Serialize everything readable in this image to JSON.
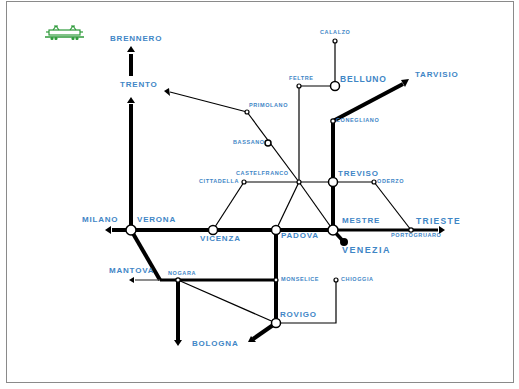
{
  "map": {
    "title_icon": "electric-locomotive-icon",
    "colors": {
      "line": "#000000",
      "label": "#3f86c6",
      "icon": "#2e9a3a",
      "frame": "#8a8a8a"
    },
    "stations": {
      "brennero": "BRENNERO",
      "trento": "TRENTO",
      "calalzo": "CALALZO",
      "feltre": "FELTRE",
      "belluno": "BELLUNO",
      "tarvisio": "TARVISIO",
      "primolano": "PRIMOLANO",
      "bassano": "BASSANO",
      "conegliano": "CONEGLIANO",
      "castelfranco": "CASTELFRANCO",
      "cittadella": "CITTADELLA",
      "treviso": "TREVISO",
      "oderzo": "ODERZO",
      "milano": "MILANO",
      "verona": "VERONA",
      "vicenza": "VICENZA",
      "padova": "PADOVA",
      "mestre": "MESTRE",
      "trieste": "TRIESTE",
      "portogruaro": "PORTOGRUARO",
      "venezia": "VENEZIA",
      "mantova": "MANTOVA",
      "nogara": "NOGARA",
      "monselice": "MONSELICE",
      "chioggia": "CHIOGGIA",
      "rovigo": "ROVIGO",
      "bologna": "BOLOGNA"
    }
  }
}
